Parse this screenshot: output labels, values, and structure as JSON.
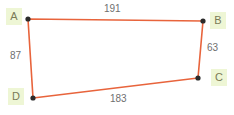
{
  "figure": {
    "type": "quadrilateral-diagram",
    "background_color": "#ffffff",
    "edge_color": "#e8643c",
    "vertex_dot_color": "#2b2b2b",
    "label_background_color": "#eef6d5",
    "label_text_color": "#7a7a56",
    "measure_text_color": "#6f6f6f",
    "vertices": [
      {
        "name": "A",
        "label": "A",
        "x": 28,
        "y": 19
      },
      {
        "name": "B",
        "label": "B",
        "x": 203,
        "y": 21
      },
      {
        "name": "C",
        "label": "C",
        "x": 198,
        "y": 78
      },
      {
        "name": "D",
        "label": "D",
        "x": 33,
        "y": 98
      }
    ],
    "edges": [
      {
        "name": "AB",
        "from": "A",
        "to": "B",
        "measure": "191",
        "label_x": 104,
        "label_y": 3
      },
      {
        "name": "BC",
        "from": "B",
        "to": "C",
        "measure": "63",
        "label_x": 207,
        "label_y": 42
      },
      {
        "name": "CD",
        "from": "C",
        "to": "D",
        "measure": "183",
        "label_x": 110,
        "label_y": 93
      },
      {
        "name": "DA",
        "from": "D",
        "to": "A",
        "measure": "87",
        "label_x": 10,
        "label_y": 50
      }
    ]
  }
}
